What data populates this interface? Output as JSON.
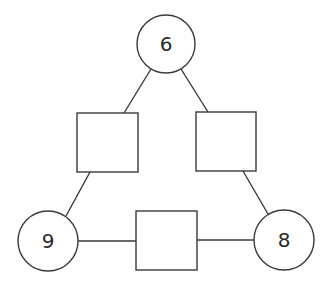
{
  "diagram": {
    "type": "number-triangle",
    "stroke_color": "#3a3a3a",
    "background": "#ffffff",
    "circles": [
      {
        "id": "top",
        "label": "6",
        "cx": 166,
        "cy": 44,
        "r": 29
      },
      {
        "id": "bottom-left",
        "label": "9",
        "cx": 48,
        "cy": 241,
        "r": 30
      },
      {
        "id": "bottom-right",
        "label": "8",
        "cx": 284,
        "cy": 240,
        "r": 30
      }
    ],
    "squares": [
      {
        "id": "left",
        "label": "",
        "x": 77,
        "y": 113,
        "w": 61,
        "h": 59
      },
      {
        "id": "right",
        "label": "",
        "x": 196,
        "y": 112,
        "w": 60,
        "h": 59
      },
      {
        "id": "bottom",
        "label": "",
        "x": 136,
        "y": 211,
        "w": 61,
        "h": 59
      }
    ],
    "edges": [
      {
        "from": "top",
        "to": "left"
      },
      {
        "from": "top",
        "to": "right"
      },
      {
        "from": "left",
        "to": "bottom-left"
      },
      {
        "from": "right",
        "to": "bottom-right"
      },
      {
        "from": "bottom-left",
        "to": "bottom"
      },
      {
        "from": "bottom",
        "to": "bottom-right"
      }
    ]
  }
}
